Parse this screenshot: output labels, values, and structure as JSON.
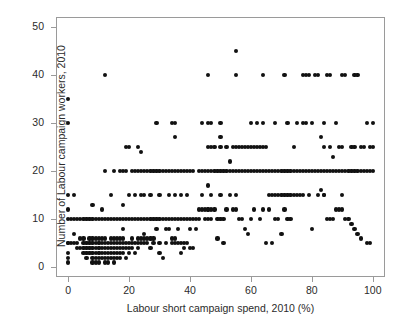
{
  "caption_remnant": "",
  "chart_data": {
    "type": "scatter",
    "title": "",
    "xlabel": "Labour short campaign spend, 2010 (%)",
    "ylabel": "Number of Labour campaign workers, 2010",
    "xlim": [
      -4,
      104
    ],
    "ylim": [
      -2,
      52
    ],
    "xticks": [
      0,
      20,
      40,
      60,
      80,
      100
    ],
    "yticks": [
      0,
      10,
      20,
      30,
      40,
      50
    ],
    "xtick_labels": [
      "0",
      "20",
      "40",
      "60",
      "80",
      "100"
    ],
    "ytick_labels": [
      "0",
      "10",
      "20",
      "30",
      "40",
      "50"
    ],
    "grid": false,
    "legend": false,
    "marker": "filled-circle",
    "marker_color": "#111111",
    "marker_size_px": 4.2,
    "frame_color": "#9a9a9a",
    "background": "#ffffff",
    "n_points": 344,
    "points": [
      [
        0,
        35
      ],
      [
        0,
        30
      ],
      [
        0,
        15
      ],
      [
        0,
        12
      ],
      [
        0,
        10
      ],
      [
        0,
        5
      ],
      [
        0,
        5
      ],
      [
        0,
        3
      ],
      [
        0,
        2
      ],
      [
        0,
        1
      ],
      [
        1,
        10
      ],
      [
        1,
        5
      ],
      [
        2,
        15
      ],
      [
        2,
        10
      ],
      [
        2,
        7
      ],
      [
        2,
        5
      ],
      [
        3,
        10
      ],
      [
        3,
        5
      ],
      [
        3,
        4
      ],
      [
        4,
        10
      ],
      [
        4,
        6
      ],
      [
        4,
        4
      ],
      [
        5,
        10
      ],
      [
        5,
        6
      ],
      [
        5,
        5
      ],
      [
        5,
        4
      ],
      [
        5,
        3
      ],
      [
        6,
        10
      ],
      [
        6,
        5
      ],
      [
        6,
        4
      ],
      [
        6,
        3
      ],
      [
        6,
        2
      ],
      [
        7,
        10
      ],
      [
        7,
        6
      ],
      [
        7,
        5
      ],
      [
        7,
        4
      ],
      [
        7,
        3
      ],
      [
        8,
        13
      ],
      [
        8,
        10
      ],
      [
        8,
        6
      ],
      [
        8,
        5
      ],
      [
        8,
        4
      ],
      [
        8,
        3
      ],
      [
        8,
        2
      ],
      [
        8,
        1
      ],
      [
        9,
        10
      ],
      [
        9,
        6
      ],
      [
        9,
        5
      ],
      [
        9,
        4
      ],
      [
        9,
        3
      ],
      [
        9,
        2
      ],
      [
        9,
        1
      ],
      [
        10,
        10
      ],
      [
        10,
        6
      ],
      [
        10,
        5
      ],
      [
        10,
        5
      ],
      [
        10,
        4
      ],
      [
        10,
        4
      ],
      [
        10,
        3
      ],
      [
        10,
        3
      ],
      [
        10,
        2
      ],
      [
        10,
        1
      ],
      [
        11,
        10
      ],
      [
        11,
        12
      ],
      [
        11,
        6
      ],
      [
        11,
        5
      ],
      [
        11,
        4
      ],
      [
        11,
        3
      ],
      [
        11,
        2
      ],
      [
        12,
        40
      ],
      [
        12,
        20
      ],
      [
        12,
        10
      ],
      [
        12,
        6
      ],
      [
        12,
        5
      ],
      [
        12,
        4
      ],
      [
        12,
        3
      ],
      [
        12,
        2
      ],
      [
        12,
        1
      ],
      [
        13,
        10
      ],
      [
        13,
        5
      ],
      [
        13,
        4
      ],
      [
        13,
        3
      ],
      [
        13,
        2
      ],
      [
        13,
        1
      ],
      [
        14,
        15
      ],
      [
        14,
        10
      ],
      [
        14,
        6
      ],
      [
        14,
        5
      ],
      [
        14,
        4
      ],
      [
        14,
        3
      ],
      [
        14,
        2
      ],
      [
        15,
        20
      ],
      [
        15,
        10
      ],
      [
        15,
        6
      ],
      [
        15,
        5
      ],
      [
        15,
        4
      ],
      [
        15,
        3
      ],
      [
        15,
        2
      ],
      [
        15,
        1
      ],
      [
        16,
        10
      ],
      [
        16,
        6
      ],
      [
        16,
        5
      ],
      [
        16,
        4
      ],
      [
        16,
        3
      ],
      [
        16,
        2
      ],
      [
        17,
        20
      ],
      [
        17,
        10
      ],
      [
        17,
        6
      ],
      [
        17,
        5
      ],
      [
        17,
        4
      ],
      [
        17,
        3
      ],
      [
        17,
        2
      ],
      [
        18,
        20
      ],
      [
        18,
        13
      ],
      [
        18,
        10
      ],
      [
        18,
        8
      ],
      [
        18,
        6
      ],
      [
        18,
        5
      ],
      [
        18,
        4
      ],
      [
        18,
        3
      ],
      [
        19,
        25
      ],
      [
        19,
        20
      ],
      [
        19,
        10
      ],
      [
        19,
        5
      ],
      [
        19,
        4
      ],
      [
        19,
        2
      ],
      [
        20,
        25
      ],
      [
        20,
        15
      ],
      [
        20,
        10
      ],
      [
        20,
        5
      ],
      [
        20,
        4
      ],
      [
        20,
        3
      ],
      [
        21,
        20
      ],
      [
        21,
        10
      ],
      [
        21,
        6
      ],
      [
        21,
        5
      ],
      [
        21,
        4
      ],
      [
        22,
        20
      ],
      [
        22,
        15
      ],
      [
        22,
        10
      ],
      [
        22,
        5
      ],
      [
        22,
        3
      ],
      [
        23,
        25
      ],
      [
        23,
        20
      ],
      [
        23,
        10
      ],
      [
        23,
        6
      ],
      [
        23,
        5
      ],
      [
        23,
        4
      ],
      [
        24,
        24
      ],
      [
        24,
        20
      ],
      [
        24,
        15
      ],
      [
        24,
        10
      ],
      [
        24,
        6
      ],
      [
        24,
        5
      ],
      [
        25,
        20
      ],
      [
        25,
        15
      ],
      [
        25,
        10
      ],
      [
        25,
        7
      ],
      [
        25,
        6
      ],
      [
        25,
        5
      ],
      [
        26,
        20
      ],
      [
        26,
        10
      ],
      [
        26,
        6
      ],
      [
        26,
        5
      ],
      [
        27,
        20
      ],
      [
        27,
        15
      ],
      [
        27,
        10
      ],
      [
        27,
        6
      ],
      [
        27,
        4
      ],
      [
        28,
        20
      ],
      [
        28,
        10
      ],
      [
        28,
        6
      ],
      [
        28,
        5
      ],
      [
        29,
        30
      ],
      [
        29,
        20
      ],
      [
        29,
        10
      ],
      [
        29,
        8
      ],
      [
        30,
        20
      ],
      [
        30,
        15
      ],
      [
        30,
        10
      ],
      [
        30,
        5
      ],
      [
        30,
        3
      ],
      [
        31,
        20
      ],
      [
        31,
        10
      ],
      [
        31,
        2
      ],
      [
        32,
        20
      ],
      [
        32,
        10
      ],
      [
        32,
        8
      ],
      [
        32,
        5
      ],
      [
        33,
        20
      ],
      [
        33,
        15
      ],
      [
        33,
        10
      ],
      [
        33,
        8
      ],
      [
        34,
        30
      ],
      [
        34,
        20
      ],
      [
        34,
        10
      ],
      [
        34,
        6
      ],
      [
        34,
        5
      ],
      [
        35,
        30
      ],
      [
        35,
        27
      ],
      [
        35,
        20
      ],
      [
        35,
        15
      ],
      [
        35,
        10
      ],
      [
        35,
        6
      ],
      [
        35,
        5
      ],
      [
        36,
        20
      ],
      [
        36,
        10
      ],
      [
        36,
        8
      ],
      [
        36,
        5
      ],
      [
        37,
        20
      ],
      [
        37,
        15
      ],
      [
        37,
        10
      ],
      [
        37,
        5
      ],
      [
        37,
        3
      ],
      [
        38,
        20
      ],
      [
        38,
        10
      ],
      [
        38,
        5
      ],
      [
        38,
        4
      ],
      [
        39,
        20
      ],
      [
        39,
        15
      ],
      [
        39,
        10
      ],
      [
        39,
        5
      ],
      [
        40,
        20
      ],
      [
        40,
        10
      ],
      [
        40,
        8
      ],
      [
        40,
        4
      ],
      [
        41,
        20
      ],
      [
        41,
        10
      ],
      [
        41,
        4
      ],
      [
        42,
        10
      ],
      [
        42,
        8
      ],
      [
        43,
        20
      ],
      [
        43,
        12
      ],
      [
        43,
        10
      ],
      [
        44,
        30
      ],
      [
        44,
        20
      ],
      [
        44,
        15
      ],
      [
        44,
        12
      ],
      [
        45,
        20
      ],
      [
        45,
        12
      ],
      [
        45,
        10
      ],
      [
        46,
        40
      ],
      [
        46,
        30
      ],
      [
        46,
        25
      ],
      [
        46,
        20
      ],
      [
        46,
        17
      ],
      [
        46,
        12
      ],
      [
        46,
        12
      ],
      [
        46,
        10
      ],
      [
        47,
        30
      ],
      [
        47,
        25
      ],
      [
        47,
        20
      ],
      [
        47,
        15
      ],
      [
        47,
        12
      ],
      [
        47,
        10
      ],
      [
        48,
        25
      ],
      [
        48,
        20
      ],
      [
        48,
        12
      ],
      [
        49,
        20
      ],
      [
        49,
        10
      ],
      [
        49,
        6
      ],
      [
        50,
        30
      ],
      [
        50,
        27
      ],
      [
        50,
        25
      ],
      [
        50,
        20
      ],
      [
        50,
        15
      ],
      [
        50,
        10
      ],
      [
        51,
        20
      ],
      [
        51,
        10
      ],
      [
        51,
        5
      ],
      [
        52,
        25
      ],
      [
        52,
        20
      ],
      [
        52,
        12
      ],
      [
        53,
        22
      ],
      [
        53,
        20
      ],
      [
        53,
        15
      ],
      [
        54,
        25
      ],
      [
        54,
        20
      ],
      [
        54,
        12
      ],
      [
        55,
        45
      ],
      [
        55,
        40
      ],
      [
        55,
        25
      ],
      [
        55,
        20
      ],
      [
        55,
        15
      ],
      [
        55,
        12
      ],
      [
        56,
        25
      ],
      [
        56,
        20
      ],
      [
        56,
        10
      ],
      [
        57,
        25
      ],
      [
        57,
        20
      ],
      [
        57,
        10
      ],
      [
        58,
        25
      ],
      [
        58,
        20
      ],
      [
        58,
        8
      ],
      [
        59,
        25
      ],
      [
        59,
        20
      ],
      [
        59,
        7
      ],
      [
        60,
        30
      ],
      [
        60,
        25
      ],
      [
        60,
        20
      ],
      [
        60,
        10
      ],
      [
        61,
        25
      ],
      [
        61,
        20
      ],
      [
        61,
        12
      ],
      [
        62,
        30
      ],
      [
        62,
        25
      ],
      [
        62,
        20
      ],
      [
        63,
        25
      ],
      [
        63,
        20
      ],
      [
        63,
        10
      ],
      [
        64,
        40
      ],
      [
        64,
        30
      ],
      [
        64,
        25
      ],
      [
        64,
        20
      ],
      [
        64,
        12
      ],
      [
        65,
        25
      ],
      [
        65,
        20
      ],
      [
        65,
        5
      ],
      [
        66,
        20
      ],
      [
        66,
        15
      ],
      [
        66,
        12
      ],
      [
        67,
        20
      ],
      [
        67,
        15
      ],
      [
        67,
        5
      ],
      [
        68,
        30
      ],
      [
        68,
        20
      ],
      [
        68,
        15
      ],
      [
        68,
        10
      ],
      [
        69,
        20
      ],
      [
        69,
        15
      ],
      [
        69,
        10
      ],
      [
        70,
        20
      ],
      [
        70,
        15
      ],
      [
        70,
        7
      ],
      [
        71,
        40
      ],
      [
        71,
        20
      ],
      [
        71,
        15
      ],
      [
        71,
        12
      ],
      [
        72,
        30
      ],
      [
        72,
        20
      ],
      [
        72,
        15
      ],
      [
        72,
        10
      ],
      [
        73,
        20
      ],
      [
        73,
        15
      ],
      [
        73,
        10
      ],
      [
        74,
        25
      ],
      [
        74,
        20
      ],
      [
        74,
        15
      ],
      [
        75,
        30
      ],
      [
        75,
        20
      ],
      [
        75,
        15
      ],
      [
        76,
        20
      ],
      [
        76,
        15
      ],
      [
        77,
        40
      ],
      [
        77,
        30
      ],
      [
        77,
        20
      ],
      [
        77,
        15
      ],
      [
        78,
        40
      ],
      [
        78,
        30
      ],
      [
        78,
        20
      ],
      [
        79,
        40
      ],
      [
        79,
        20
      ],
      [
        79,
        15
      ],
      [
        80,
        30
      ],
      [
        80,
        20
      ],
      [
        80,
        8
      ],
      [
        81,
        40
      ],
      [
        81,
        20
      ],
      [
        82,
        40
      ],
      [
        82,
        20
      ],
      [
        82,
        15
      ],
      [
        83,
        27
      ],
      [
        83,
        20
      ],
      [
        83,
        16
      ],
      [
        84,
        30
      ],
      [
        84,
        25
      ],
      [
        84,
        20
      ],
      [
        84,
        15
      ],
      [
        84,
        15
      ],
      [
        85,
        40
      ],
      [
        85,
        20
      ],
      [
        85,
        10
      ],
      [
        86,
        40
      ],
      [
        86,
        25
      ],
      [
        86,
        20
      ],
      [
        86,
        10
      ],
      [
        87,
        23
      ],
      [
        87,
        20
      ],
      [
        87,
        10
      ],
      [
        88,
        30
      ],
      [
        88,
        20
      ],
      [
        88,
        12
      ],
      [
        89,
        25
      ],
      [
        89,
        20
      ],
      [
        89,
        12
      ],
      [
        90,
        40
      ],
      [
        90,
        25
      ],
      [
        90,
        20
      ],
      [
        90,
        15
      ],
      [
        90,
        12
      ],
      [
        91,
        40
      ],
      [
        91,
        20
      ],
      [
        91,
        10
      ],
      [
        92,
        20
      ],
      [
        92,
        10
      ],
      [
        93,
        25
      ],
      [
        93,
        20
      ],
      [
        93,
        9
      ],
      [
        94,
        40
      ],
      [
        94,
        25
      ],
      [
        94,
        20
      ],
      [
        94,
        8
      ],
      [
        95,
        40
      ],
      [
        95,
        20
      ],
      [
        95,
        7
      ],
      [
        96,
        25
      ],
      [
        96,
        20
      ],
      [
        96,
        6
      ],
      [
        97,
        25
      ],
      [
        97,
        20
      ],
      [
        98,
        30
      ],
      [
        98,
        20
      ],
      [
        98,
        5
      ],
      [
        99,
        25
      ],
      [
        99,
        20
      ],
      [
        99,
        5
      ],
      [
        100,
        30
      ],
      [
        100,
        25
      ],
      [
        100,
        20
      ]
    ]
  }
}
